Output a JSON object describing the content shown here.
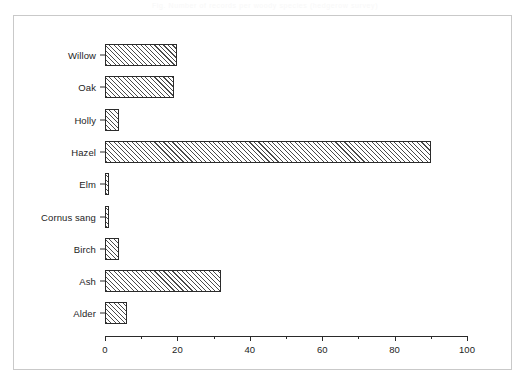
{
  "caption": {
    "text": "Fig. Number of records per woody species (hedgerow survey)"
  },
  "chart_data": {
    "type": "bar",
    "orientation": "horizontal",
    "title": "",
    "xlabel": "",
    "ylabel": "",
    "categories": [
      "Willow",
      "Oak",
      "Holly",
      "Hazel",
      "Elm",
      "Cornus sang",
      "Birch",
      "Ash",
      "Alder"
    ],
    "values": [
      20,
      19,
      4,
      90,
      1,
      1,
      4,
      32,
      6
    ],
    "xlim": [
      0,
      100
    ],
    "xticks": [
      0,
      20,
      40,
      60,
      80,
      100
    ],
    "xtick_labels": [
      "0",
      "20",
      "40",
      "60",
      "80",
      "100"
    ],
    "xminor_ticks": [
      10,
      30,
      50,
      70,
      90
    ],
    "grid": false,
    "legend": null,
    "bar_fill": "diagonal-hatch",
    "bar_edge_color": "#2b2b2b",
    "axis_color": "#2a2a2a",
    "frame_color": "#c9c9c9",
    "background": "#ffffff"
  }
}
